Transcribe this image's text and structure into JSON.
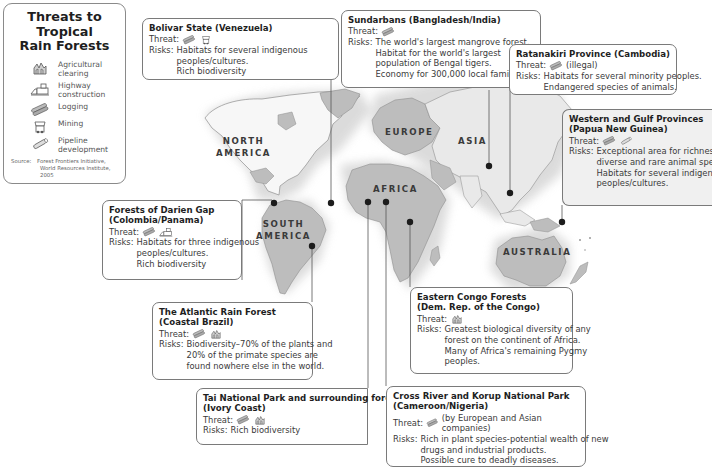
{
  "legend": {
    "title_line1": "Threats to Tropical",
    "title_line2": "Rain Forests",
    "items": [
      {
        "icon": "agricultural-clearing-icon",
        "label_line1": "Agricultural",
        "label_line2": "clearing"
      },
      {
        "icon": "highway-construction-icon",
        "label_line1": "Highway",
        "label_line2": "construction"
      },
      {
        "icon": "logging-icon",
        "label_line1": "Logging",
        "label_line2": ""
      },
      {
        "icon": "mining-icon",
        "label_line1": "Mining",
        "label_line2": ""
      },
      {
        "icon": "pipeline-development-icon",
        "label_line1": "Pipeline",
        "label_line2": "development"
      }
    ],
    "source_label": "Source:",
    "source_line1": "Forest Frontiers Initiative,",
    "source_line2": "World Resources Institute, 2005"
  },
  "continents": {
    "north_america_1": "NORTH",
    "north_america_2": "AMERICA",
    "south_america_1": "SOUTH",
    "south_america_2": "AMERICA",
    "europe": "EUROPE",
    "asia": "ASIA",
    "africa": "AFRICA",
    "australia": "AUSTRALIA"
  },
  "labels": {
    "threat": "Threat:",
    "risks": "Risks:"
  },
  "sites": {
    "bolivar": {
      "title1": "Bolivar State (Venezuela)",
      "threats": [
        "logging-icon",
        "mining-icon"
      ],
      "threat_note": "",
      "risks": [
        "Habitats for several indigenous",
        "peoples/cultures.",
        "Rich biodiversity"
      ]
    },
    "sundarbans": {
      "title1": "Sundarbans (Bangladesh/India)",
      "threats": [
        "logging-icon"
      ],
      "threat_note": "",
      "risks": [
        "The world's largest mangrove forest.",
        "Habitat for the world's largest",
        "population of Bengal tigers.",
        "Economy for 300,000 local families"
      ]
    },
    "ratanakiri": {
      "title1": "Ratanakiri Province (Cambodia)",
      "threats": [
        "logging-icon"
      ],
      "threat_note": "(illegal)",
      "risks": [
        "Habitats for several minority peoples.",
        "Endangered species of animals."
      ]
    },
    "papua": {
      "title1": "Western and Gulf Provinces",
      "title2": "(Papua New Guinea)",
      "threats": [
        "logging-icon",
        "pipeline-development-icon"
      ],
      "threat_note": "",
      "risks": [
        "Exceptional area for richness of",
        "diverse and rare animal species.",
        "Habitats for several indigenous",
        "peoples/cultures."
      ]
    },
    "darien": {
      "title1": "Forests of Darien Gap",
      "title2": "(Colombia/Panama)",
      "threats": [
        "logging-icon",
        "highway-construction-icon"
      ],
      "threat_note": "",
      "risks": [
        "Habitats for three indigenous",
        "peoples/cultures.",
        "Rich biodiversity"
      ]
    },
    "atlantic": {
      "title1": "The Atlantic Rain Forest",
      "title2": "(Coastal Brazil)",
      "threats": [
        "logging-icon",
        "agricultural-clearing-icon"
      ],
      "threat_note": "",
      "risks": [
        "Biodiversity–70% of the plants and",
        "20% of the primate species are",
        "found nowhere else in the world."
      ]
    },
    "tai": {
      "title1": "Tai National Park and surrounding forests",
      "title2": "(Ivory Coast)",
      "threats": [
        "logging-icon",
        "agricultural-clearing-icon"
      ],
      "threat_note": "",
      "risks": [
        "Rich biodiversity"
      ]
    },
    "congo": {
      "title1": "Eastern Congo Forests",
      "title2": "(Dem. Rep. of the Congo)",
      "threats": [
        "agricultural-clearing-icon"
      ],
      "threat_note": "",
      "risks": [
        "Greatest biological diversity of any",
        "forest on the continent of Africa.",
        "Many of Africa's remaining Pygmy",
        "peoples."
      ]
    },
    "crossriver": {
      "title1": "Cross River and Korup National Park",
      "title2": "(Cameroon/Nigeria)",
      "threats": [
        "logging-icon"
      ],
      "threat_note": "(by European and Asian companies)",
      "risks": [
        "Rich in plant species-potential wealth of new",
        "drugs and industrial products.",
        "Possible cure to deadly diseases."
      ]
    }
  },
  "colors": {
    "land": "#bdbdbd",
    "land_dark": "#a9a9a9",
    "land_light": "#f4f4f4",
    "box_border": "#7a7a7a",
    "marker": "#1c1c1c",
    "leader": "#555555"
  }
}
